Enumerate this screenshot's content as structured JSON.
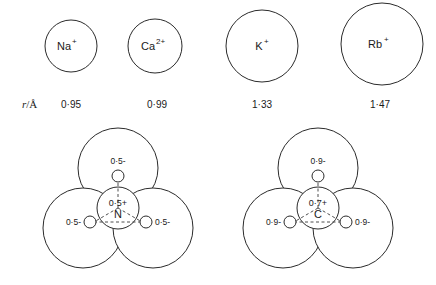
{
  "figure": {
    "type": "scientific-diagram"
  },
  "ion_row": {
    "axis_label": "r",
    "axis_separator": "/",
    "axis_unit": "Å",
    "ions": [
      {
        "name": "Na",
        "charge": "+",
        "radius": "0·95",
        "cx": 71,
        "cy": 46,
        "r": 26
      },
      {
        "name": "Ca",
        "charge": "2+",
        "radius": "0·99",
        "cx": 155,
        "cy": 46,
        "r": 27
      },
      {
        "name": "K",
        "charge": "+",
        "radius": "1·33",
        "cx": 262,
        "cy": 46,
        "r": 36
      },
      {
        "name": "Rb",
        "charge": "+",
        "radius": "1·47",
        "cx": 382,
        "cy": 44,
        "r": 41
      }
    ]
  },
  "molecules": [
    {
      "id": "nitrate-model",
      "center_atom": "N",
      "center_charge": "0·5+",
      "ligand_charges": [
        "0·5-",
        "0·5-",
        "0·5-"
      ],
      "cx": 118,
      "cy": 208,
      "lobe_radius": 40,
      "lobe_distance": 40,
      "core_radius": 21,
      "dot_radius": 6,
      "dot_distance": 28
    },
    {
      "id": "carbonate-model",
      "center_atom": "C",
      "center_charge": "0·7+",
      "ligand_charges": [
        "0·9-",
        "0·9-",
        "0·9-"
      ],
      "cx": 318,
      "cy": 208,
      "lobe_radius": 40,
      "lobe_distance": 40,
      "core_radius": 21,
      "dot_radius": 6,
      "dot_distance": 28
    }
  ],
  "colors": {
    "stroke": "#2b2b2b",
    "background": "#ffffff",
    "text": "#1a1a1a"
  }
}
